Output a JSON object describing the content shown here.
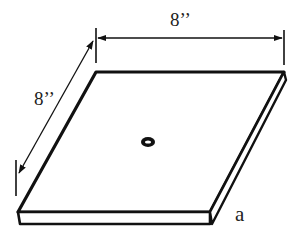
{
  "diagram": {
    "labels": {
      "top_dimension": "8’’",
      "left_dimension": "8’’",
      "figure_label": "a"
    },
    "dimensions": {
      "width": "8 in",
      "depth": "8 in"
    },
    "colors": {
      "stroke": "#111111",
      "background": "#ffffff"
    }
  }
}
